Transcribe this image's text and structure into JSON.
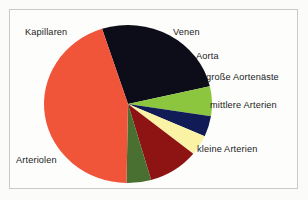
{
  "chart_data": {
    "type": "pie",
    "title": "",
    "subtitle": "",
    "xlabel": "",
    "ylabel": "",
    "legend_position": "outside-labels",
    "grid": false,
    "labels_outside": true,
    "start_angle_deg": -18,
    "direction": "clockwise",
    "categories": [
      "Kapillaren",
      "Venen",
      "Aorta",
      "große Aortenäste",
      "mittlere Arterien",
      "kleine Arterien",
      "Arteriolen"
    ],
    "values": [
      26,
      6,
      4,
      4,
      10,
      5,
      45
    ],
    "slice_angles_deg": [
      95,
      22,
      15,
      15,
      35,
      17,
      161
    ],
    "colors": [
      "#0d0d1a",
      "#8cc63f",
      "#111c56",
      "#faf3a5",
      "#8e1414",
      "#4a7031",
      "#f0553a"
    ],
    "slices": [
      {
        "label": "Kapillaren",
        "value": 26,
        "angle_deg": 95,
        "color": "#0d0d1a"
      },
      {
        "label": "Venen",
        "value": 6,
        "angle_deg": 22,
        "color": "#8cc63f"
      },
      {
        "label": "Aorta",
        "value": 4,
        "angle_deg": 15,
        "color": "#111c56"
      },
      {
        "label": "große Aortenäste",
        "value": 4,
        "angle_deg": 15,
        "color": "#faf3a5"
      },
      {
        "label": "mittlere Arterien",
        "value": 10,
        "angle_deg": 35,
        "color": "#8e1414"
      },
      {
        "label": "kleine Arterien",
        "value": 5,
        "angle_deg": 17,
        "color": "#4a7031"
      },
      {
        "label": "Arteriolen",
        "value": 45,
        "angle_deg": 161,
        "color": "#f0553a"
      }
    ]
  },
  "figure": {
    "background_color": "#fbfbfa",
    "frame_color": "#c9c9c9",
    "pie_center_x": 128,
    "pie_center_y": 104,
    "pie_radius_x": 84,
    "pie_radius_y": 79
  },
  "labels": {
    "kapillaren": "Kapillaren",
    "venen": "Venen",
    "aorta": "Aorta",
    "grosse_aortenaeste": "große Aortenäste",
    "mittlere_arterien": "mittlere Arterien",
    "kleine_arterien": "kleine Arterien",
    "arteriolen": "Arteriolen"
  }
}
